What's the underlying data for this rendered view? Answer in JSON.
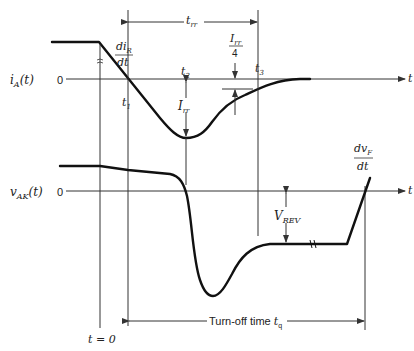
{
  "diagram": {
    "top_plot": {
      "ylabel_main": "i",
      "ylabel_sub": "A",
      "ylabel_arg": "(t)",
      "zero_label": "0",
      "axis_label": "t",
      "slope_label_num": "di",
      "slope_label_num_sub": "R",
      "slope_label_den": "dt",
      "points": {
        "t1": {
          "main": "t",
          "sub": "1"
        },
        "t2": {
          "main": "t",
          "sub": "2"
        },
        "t3": {
          "main": "t",
          "sub": "3"
        }
      },
      "irr_label": {
        "main": "I",
        "sub": "rr"
      },
      "irr_quarter_label": {
        "num_main": "I",
        "num_sub": "rr",
        "den": "4"
      },
      "trr_label": {
        "main": "t",
        "sub": "rr"
      }
    },
    "bottom_plot": {
      "ylabel_main": "v",
      "ylabel_sub": "AK",
      "ylabel_arg": "(t)",
      "zero_label": "0",
      "axis_label": "t",
      "slope_label_num": "dv",
      "slope_label_num_sub": "F",
      "slope_label_den": "dt",
      "vrev_label": {
        "main": "V",
        "sub": "REV"
      }
    },
    "time_zero_label": "t = 0",
    "turnoff_label": "Turn-off time ",
    "turnoff_sym": {
      "main": "t",
      "sub": "q"
    }
  }
}
